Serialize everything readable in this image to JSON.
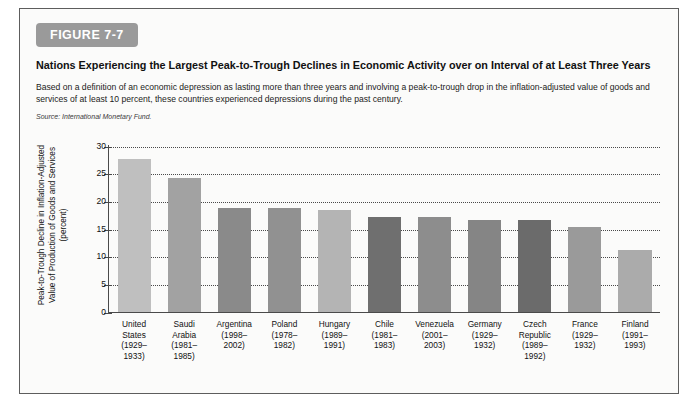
{
  "figure": {
    "badge": "FIGURE 7-7",
    "title": "Nations Experiencing the Largest Peak-to-Trough Declines in Economic Activity over on Interval of at Least Three Years",
    "subtitle": "Based on a definition of an economic depression as lasting more than three years and involving a peak-to-trough drop in the inflation-adjusted value of goods and services of at least 10 percent, these countries experienced depressions during the past century.",
    "source": "Source: International Monetary Fund.",
    "badge_color": "#9a9a9a",
    "frame_color": "#5d5d5d",
    "background": "#fbfbfa"
  },
  "chart_data": {
    "type": "bar",
    "title": "Nations Experiencing the Largest Peak-to-Trough Declines in Economic Activity over on Interval of at Least Three Years",
    "xlabel": "",
    "ylabel": "Peak-to-Trough Decline in Inflation-Adjusted Value of Production of Goods and Services (percent)",
    "ylim": [
      0,
      30
    ],
    "yticks": [
      0,
      5,
      10,
      15,
      20,
      25,
      30
    ],
    "ytick_labels": [
      "0",
      "5",
      "10",
      "15",
      "20",
      "25",
      "30"
    ],
    "grid": true,
    "grid_style": "dotted-horizontal",
    "legend": "none",
    "categories": [
      "United States\n(1929–\n1933)",
      "Saudi Arabia\n(1981–\n1985)",
      "Argentina\n(1998–\n2002)",
      "Poland\n(1978–\n1982)",
      "Hungary\n(1989–\n1991)",
      "Chile\n(1981–\n1983)",
      "Venezuela\n(2001–\n2003)",
      "Germany\n(1929–\n1932)",
      "Czech Republic\n(1989–\n1992)",
      "France\n(1929–\n1932)",
      "Finland\n(1991–\n1993)"
    ],
    "values": [
      27.6,
      24.2,
      18.7,
      18.7,
      18.4,
      17.0,
      17.0,
      16.5,
      16.5,
      15.2,
      11.1
    ],
    "bar_colors": [
      "#bfbfbf",
      "#a2a2a2",
      "#8a8a8a",
      "#919191",
      "#b4b4b4",
      "#6f6f6f",
      "#8d8d8d",
      "#858585",
      "#6b6b6b",
      "#9a9a9a",
      "#ababab"
    ],
    "bars": [
      {
        "country": "United States",
        "period": "(1929–1933)",
        "line1": "United",
        "line2": "States",
        "line3": "(1929–",
        "line4": "1933)",
        "value": 27.6,
        "color": "#bfbfbf"
      },
      {
        "country": "Saudi Arabia",
        "period": "(1981–1985)",
        "line1": "Saudi",
        "line2": "Arabia",
        "line3": "(1981–",
        "line4": "1985)",
        "value": 24.2,
        "color": "#a2a2a2"
      },
      {
        "country": "Argentina",
        "period": "(1998–2002)",
        "line1": "Argentina",
        "line2": "(1998–",
        "line3": "2002)",
        "line4": "",
        "value": 18.7,
        "color": "#8a8a8a"
      },
      {
        "country": "Poland",
        "period": "(1978–1982)",
        "line1": "Poland",
        "line2": "(1978–",
        "line3": "1982)",
        "line4": "",
        "value": 18.7,
        "color": "#919191"
      },
      {
        "country": "Hungary",
        "period": "(1989–1991)",
        "line1": "Hungary",
        "line2": "(1989–",
        "line3": "1991)",
        "line4": "",
        "value": 18.4,
        "color": "#b4b4b4"
      },
      {
        "country": "Chile",
        "period": "(1981–1983)",
        "line1": "Chile",
        "line2": "(1981–",
        "line3": "1983)",
        "line4": "",
        "value": 17.0,
        "color": "#6f6f6f"
      },
      {
        "country": "Venezuela",
        "period": "(2001–2003)",
        "line1": "Venezuela",
        "line2": "(2001–",
        "line3": "2003)",
        "line4": "",
        "value": 17.0,
        "color": "#8d8d8d"
      },
      {
        "country": "Germany",
        "period": "(1929–1932)",
        "line1": "Germany",
        "line2": "(1929–",
        "line3": "1932)",
        "line4": "",
        "value": 16.5,
        "color": "#858585"
      },
      {
        "country": "Czech Republic",
        "period": "(1989–1992)",
        "line1": "Czech",
        "line2": "Republic",
        "line3": "(1989–",
        "line4": "1992)",
        "value": 16.5,
        "color": "#6b6b6b"
      },
      {
        "country": "France",
        "period": "(1929–1932)",
        "line1": "France",
        "line2": "(1929–",
        "line3": "1932)",
        "line4": "",
        "value": 15.2,
        "color": "#9a9a9a"
      },
      {
        "country": "Finland",
        "period": "(1991–1993)",
        "line1": "Finland",
        "line2": "(1991–",
        "line3": "1993)",
        "line4": "",
        "value": 11.1,
        "color": "#ababab"
      }
    ]
  }
}
